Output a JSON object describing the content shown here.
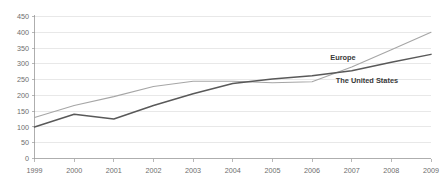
{
  "chart_data": {
    "type": "line",
    "title": "",
    "subtitle": "",
    "xlabel": "",
    "ylabel": "",
    "categories": [
      "1999",
      "2000",
      "2001",
      "2002",
      "2003",
      "2004",
      "2005",
      "2006",
      "2007",
      "2008",
      "2009"
    ],
    "ylim": [
      0,
      450
    ],
    "yticks": [
      0,
      50,
      100,
      150,
      200,
      250,
      300,
      350,
      400,
      450
    ],
    "ytick_labels": [
      "0",
      "50",
      "100",
      "150",
      "200",
      "250",
      "300",
      "350",
      "400",
      "450"
    ],
    "grid": true,
    "grid_axis": "y",
    "legend": "inline-labels",
    "series": [
      {
        "name": "Europe",
        "color": "#a6a6a6",
        "values": [
          130,
          168,
          196,
          228,
          245,
          245,
          240,
          243,
          290,
          345,
          400
        ]
      },
      {
        "name": "The United States",
        "color": "#595959",
        "values": [
          100,
          140,
          125,
          168,
          205,
          238,
          252,
          262,
          278,
          305,
          330
        ]
      }
    ],
    "annotations": [
      {
        "text": "Europe",
        "series": "Europe",
        "near_category": "2007"
      },
      {
        "text": "The United States",
        "series": "The United States",
        "near_category": "2007"
      }
    ]
  },
  "labels": {
    "europe": "Europe",
    "united_states": "The United States"
  }
}
